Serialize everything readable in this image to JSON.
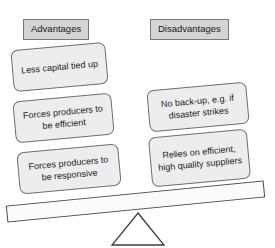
{
  "diagram": {
    "type": "balance-scale-pros-cons",
    "title_present": false,
    "columns": {
      "left": {
        "header": "Advantages",
        "cards": [
          {
            "text": "Less capital tied up"
          },
          {
            "text": "Forces producers to be efficient"
          },
          {
            "text": "Forces producers to be responsive"
          }
        ]
      },
      "right": {
        "header": "Disadvantages",
        "cards": [
          {
            "text": "No back-up, e.g. if disaster strikes"
          },
          {
            "text": "Relies on efficient, high quality suppliers"
          }
        ]
      }
    },
    "scale": {
      "beam_name": "seesaw-beam",
      "fulcrum_name": "fulcrum-triangle",
      "tilt_direction": "left-side-down"
    },
    "colors": {
      "background": "#ffffff",
      "header_fill": "#d4d4d4",
      "header_border": "#7a7a7a",
      "card_fill": "#ededed",
      "card_border": "#6e6e6e",
      "beam_fill": "#fbfbfb",
      "beam_border": "#4a4a4a",
      "fulcrum_fill": "#ffffff",
      "fulcrum_border": "#3c3c3c",
      "text": "#1a1a1a"
    }
  }
}
